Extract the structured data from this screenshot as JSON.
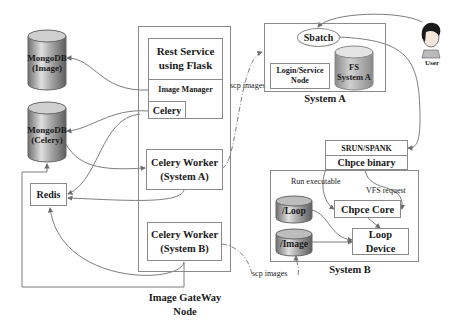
{
  "diagram": {
    "gateway": {
      "node_label": [
        "Image GateWay",
        "Node"
      ],
      "rest_service": [
        "Rest Service",
        "using Flask"
      ],
      "image_manager": "Image Manager",
      "celery": "Celery",
      "worker_a": [
        "Celery Worker",
        "(System A)"
      ],
      "worker_b": [
        "Celery Worker",
        "(System B)"
      ]
    },
    "databases": {
      "mongo_image": [
        "MongoDB",
        "(Image)"
      ],
      "mongo_celery": [
        "MongoDB",
        "(Celery)"
      ],
      "redis": "Redis"
    },
    "system_a": {
      "label": "System A",
      "sbatch": "Sbatch",
      "login_node": [
        "Login/Service",
        "Node"
      ],
      "fs": [
        "FS",
        "System A"
      ]
    },
    "user": {
      "label": "User"
    },
    "system_b": {
      "label": "System B",
      "srun_spank": "SRUN/SPANK",
      "chpce_binary": "Chpce binary",
      "chpce_core": "Chpce Core",
      "loop_device": [
        "Loop",
        "Device"
      ],
      "loop_vol": "/Loop",
      "image_vol": "/Image",
      "run_executable": "Run executable",
      "vfs_request": "VFS request"
    },
    "edge_labels": {
      "scp_images_a": "scp images",
      "scp_images_b": "scp images"
    },
    "colors": {
      "line": "#6e6e6e",
      "border": "#8a8a8a",
      "cyl_dark": "#7a7a7a",
      "cyl_light": "#d8d8d8",
      "cyl_top": "#bdbdbd"
    }
  }
}
